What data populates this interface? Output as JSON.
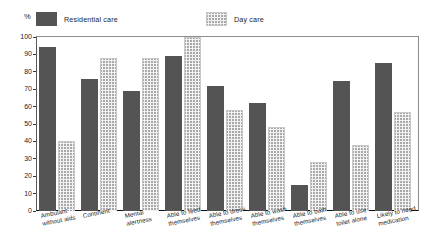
{
  "axis": {
    "percent_symbol": "%",
    "y_ticks": [
      "100",
      "90",
      "80",
      "70",
      "60",
      "50",
      "40",
      "30",
      "20",
      "10",
      "0"
    ]
  },
  "legend": {
    "entries": [
      {
        "label": "Residential care",
        "key": "residential",
        "color": "#8c8c8c"
      },
      {
        "label": "Day care",
        "key": "daycare",
        "color": "#f2f2f2"
      }
    ]
  },
  "chart_data": {
    "type": "bar",
    "title": "",
    "xlabel": "",
    "ylabel": "%",
    "ylim": [
      0,
      100
    ],
    "grid": false,
    "legend_position": "top",
    "categories": [
      "Ambulant\nwithout aids",
      "Continent",
      "Mental\nalertness",
      "Able to feed\nthemselves",
      "Able to dress\nthemselves",
      "Able to wash\nthemselves",
      "Able to bath\nthemselves",
      "Able to use\ntoilet alone",
      "Likely to need\nmedication"
    ],
    "series": [
      {
        "name": "Residential care",
        "values": [
          94,
          76,
          69,
          89,
          72,
          62,
          15,
          75,
          85
        ]
      },
      {
        "name": "Day care",
        "values": [
          40,
          88,
          88,
          100,
          58,
          48,
          28,
          38,
          57
        ]
      }
    ]
  }
}
